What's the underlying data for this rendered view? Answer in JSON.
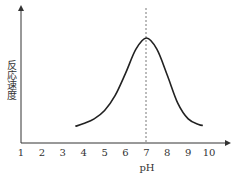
{
  "chart_data": {
    "type": "line",
    "title": "",
    "xlabel": "pH",
    "ylabel": "反応速度",
    "x_ticks": [
      "1",
      "2",
      "3",
      "4",
      "5",
      "6",
      "7",
      "8",
      "9",
      "10"
    ],
    "xlim": [
      1,
      11
    ],
    "grid": false,
    "legend": null,
    "series": [
      {
        "name": "反応速度",
        "x": [
          3.6,
          4.0,
          4.5,
          5.0,
          5.5,
          6.0,
          6.5,
          7.0,
          7.5,
          8.0,
          8.5,
          9.0,
          9.5,
          9.7
        ],
        "y": [
          0.05,
          0.08,
          0.13,
          0.22,
          0.38,
          0.62,
          0.88,
          1.0,
          0.88,
          0.6,
          0.3,
          0.13,
          0.07,
          0.06
        ]
      }
    ],
    "annotations": [
      {
        "type": "vertical-dashed-line",
        "x": 7,
        "label": "optimum pH"
      }
    ],
    "colors": {
      "axis": "#333333",
      "curve": "#222222",
      "dashed": "#555555"
    }
  },
  "labels": {
    "ylabel": "反応速度",
    "xlabel": "pH",
    "ticks": [
      "1",
      "2",
      "3",
      "4",
      "5",
      "6",
      "7",
      "8",
      "9",
      "10"
    ]
  }
}
